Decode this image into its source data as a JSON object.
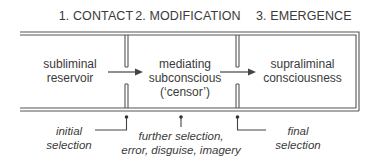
{
  "stages": [
    {
      "label": "1. CONTACT"
    },
    {
      "label": "2. MODIFICATION"
    },
    {
      "label": "3. EMERGENCE"
    }
  ],
  "boxes": [
    {
      "line1": "subliminal",
      "line2": "reservoir"
    },
    {
      "line1": "mediating",
      "line2": "subconscious",
      "line3": "(‘censor’)"
    },
    {
      "line1": "supraliminal",
      "line2": "consciousness"
    }
  ],
  "annotations": [
    {
      "line1": "initial",
      "line2": "selection"
    },
    {
      "line1": "further selection,",
      "line2": "error, disguise, imagery"
    },
    {
      "line1": "final",
      "line2": "selection"
    }
  ],
  "colors": {
    "line": "#555555",
    "text": "#3a3a3a",
    "background": "#ffffff"
  }
}
